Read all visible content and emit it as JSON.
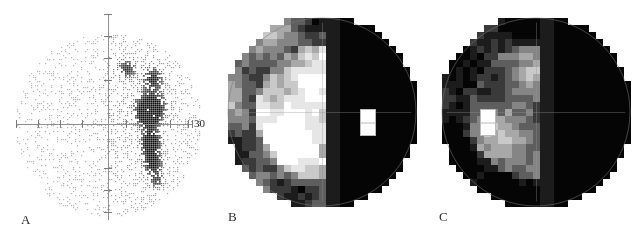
{
  "figure": {
    "caption_labels": [
      "A",
      "B",
      "C"
    ],
    "background_color": "#ffffff"
  },
  "panel_a": {
    "label": "A",
    "type": "dot-density-stimulus-map",
    "axis_tick_label": "30",
    "axis_color": "#8a8a8a",
    "dot_color": "#3a3a3a",
    "center": [
      108,
      124
    ],
    "radius": 93,
    "horizontal_axis": {
      "y": 124,
      "x_start": 16,
      "x_end": 192
    },
    "vertical_axis": {
      "x": 108,
      "y_start": 14,
      "y_end": 220
    },
    "tick_positions_x": [
      16,
      38,
      60,
      82,
      126,
      148,
      170,
      192
    ],
    "tick_positions_y": [
      14,
      36,
      58,
      80,
      168,
      190,
      212
    ],
    "scotoma_clusters": [
      {
        "cx": 126,
        "cy": 68,
        "rx": 9,
        "ry": 9,
        "density": 0.55
      },
      {
        "cx": 152,
        "cy": 78,
        "rx": 10,
        "ry": 12,
        "density": 0.62
      },
      {
        "cx": 150,
        "cy": 104,
        "rx": 14,
        "ry": 12,
        "density": 0.78
      },
      {
        "cx": 148,
        "cy": 116,
        "rx": 10,
        "ry": 9,
        "density": 0.95
      },
      {
        "cx": 150,
        "cy": 142,
        "rx": 9,
        "ry": 14,
        "density": 0.92
      },
      {
        "cx": 152,
        "cy": 164,
        "rx": 9,
        "ry": 10,
        "density": 0.62
      },
      {
        "cx": 156,
        "cy": 180,
        "rx": 7,
        "ry": 8,
        "density": 0.45
      }
    ]
  },
  "panel_b": {
    "label": "B",
    "type": "grayscale-threshold-map",
    "center": [
      322,
      112
    ],
    "radius": 94,
    "cell_size": 7,
    "blind_spot": {
      "x": 360,
      "y": 109,
      "w": 16,
      "h": 27,
      "color": "#ffffff"
    },
    "defect_side": "right",
    "gray_levels": [
      "#ffffff",
      "#e6e6e6",
      "#c9c9c9",
      "#a8a8a8",
      "#858585",
      "#5e5e5e",
      "#3a3a3a",
      "#1c1c1c",
      "#050505"
    ],
    "chart_data": {
      "type": "heatmap",
      "description": "Grayscale visual field threshold map, right hemifield dense defect",
      "grid_cols": 27,
      "grid_rows": 27,
      "value_scale": [
        0,
        8
      ]
    }
  },
  "panel_c": {
    "label": "C",
    "type": "grayscale-threshold-map",
    "center": [
      536,
      112
    ],
    "radius": 94,
    "cell_size": 7,
    "blind_spot": {
      "x": 480,
      "y": 109,
      "w": 16,
      "h": 27,
      "color": "#ffffff"
    },
    "defect_side": "right",
    "gray_levels": [
      "#ffffff",
      "#e6e6e6",
      "#c9c9c9",
      "#a8a8a8",
      "#858585",
      "#5e5e5e",
      "#3a3a3a",
      "#1c1c1c",
      "#050505"
    ],
    "chart_data": {
      "type": "heatmap",
      "description": "Grayscale visual field threshold map, mirrored, blind spot on left",
      "grid_cols": 27,
      "grid_rows": 27,
      "value_scale": [
        0,
        8
      ]
    }
  }
}
